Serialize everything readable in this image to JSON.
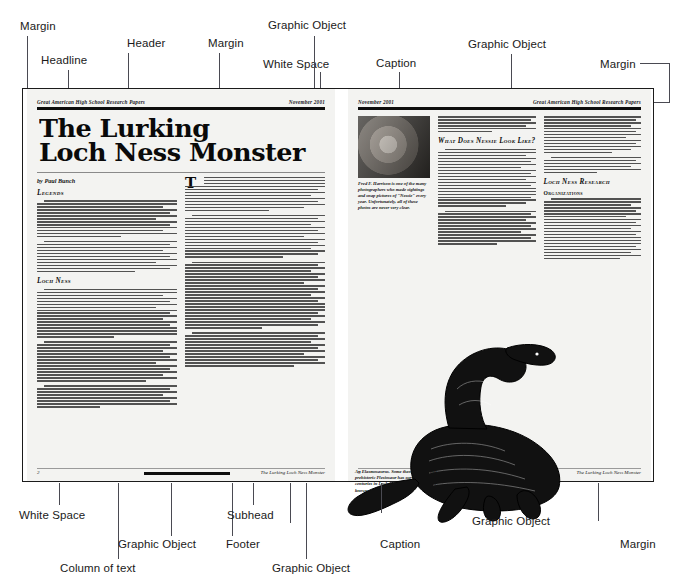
{
  "annotations": {
    "top": [
      {
        "id": "margin-tl",
        "label": "Margin"
      },
      {
        "id": "headline",
        "label": "Headline"
      },
      {
        "id": "header",
        "label": "Header"
      },
      {
        "id": "margin-top-mid",
        "label": "Margin"
      },
      {
        "id": "white-space-top",
        "label": "White Space"
      },
      {
        "id": "graphic-object-top-left",
        "label": "Graphic Object"
      },
      {
        "id": "caption-top",
        "label": "Caption"
      },
      {
        "id": "graphic-object-top-right",
        "label": "Graphic Object"
      },
      {
        "id": "margin-tr",
        "label": "Margin"
      }
    ],
    "bottom": [
      {
        "id": "white-space-bottom",
        "label": "White Space"
      },
      {
        "id": "graphic-object-bottom-left",
        "label": "Graphic Object"
      },
      {
        "id": "column-of-text",
        "label": "Column of text"
      },
      {
        "id": "subhead",
        "label": "Subhead"
      },
      {
        "id": "footer",
        "label": "Footer"
      },
      {
        "id": "caption-bottom",
        "label": "Caption"
      },
      {
        "id": "graphic-object-bottom-mid",
        "label": "Graphic Object"
      },
      {
        "id": "graphic-object-bottom-right",
        "label": "Graphic Object"
      },
      {
        "id": "margin-br",
        "label": "Margin"
      }
    ]
  },
  "document": {
    "left_page": {
      "running_head_left": "Great American High School Research Papers",
      "running_head_right": "November 2001",
      "headline_line1": "The Lurking",
      "headline_line2": "Loch Ness Monster",
      "byline": "by Paul Bunch",
      "subheads": [
        "Legends",
        "Loch Ness"
      ],
      "footer_page_number": "2",
      "footer_title": "The Lurking Loch Ness Monster"
    },
    "right_page": {
      "running_head_left": "November 2001",
      "running_head_right": "Great American High School Research Papers",
      "photo_caption": "Fred F. Harrison is one of the many photographers who made sightings and snap pictures of \"Nessie\" every year. Unfortunately, all of these photos are never very clear.",
      "subheads": [
        "What Does Nessie Look Like?",
        "Loch Ness Research",
        "Organizations"
      ],
      "figure_caption": "An Elasmosaurus. Some theories think this prehistoric Plesiosaur has survived through the centuries in Loch Ness and is the \"monster\" known as \"Nessie.\"",
      "footer_page_number": "3",
      "footer_title": "The Lurking Loch Ness Monster"
    }
  },
  "colors": {
    "ink": "#0d0d0d",
    "paper": "#f3f3f1",
    "leader": "#4a4a52",
    "label": "#1a1a1a"
  }
}
